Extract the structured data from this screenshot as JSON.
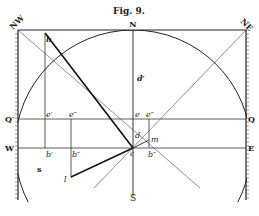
{
  "figure": {
    "title": "Fig. 9.",
    "labels": {
      "nw": "NW",
      "n": "N",
      "ne": "NE",
      "h": "h",
      "d_prime": "d′",
      "q_left": "Q′",
      "q_right": "Q",
      "e_prime": "e′",
      "e_double": "e″",
      "e": "e",
      "e_double_right": "e″",
      "d": "d",
      "m": "m",
      "w": "W",
      "east": "E",
      "b_prime": "b′",
      "b_double": "b″",
      "c": "c",
      "b_double_right": "b″",
      "s_small": "s",
      "l": "l",
      "s": "S"
    }
  }
}
